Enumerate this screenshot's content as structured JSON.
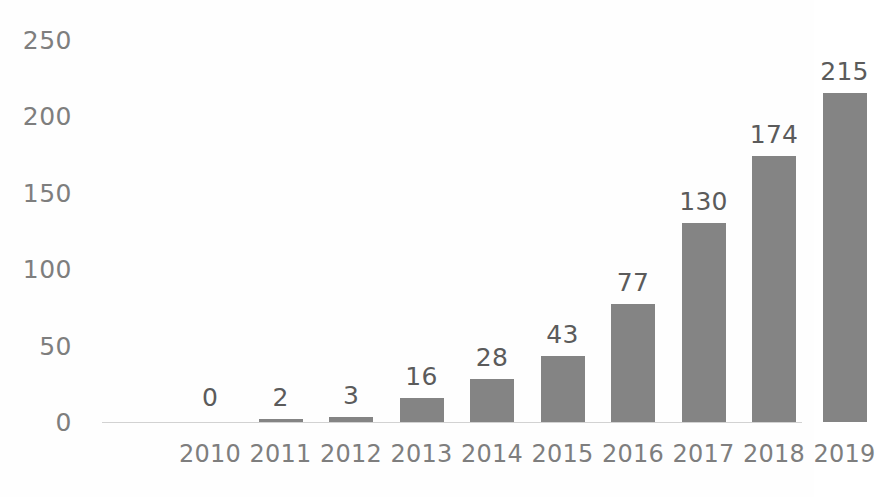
{
  "chart_data": {
    "type": "bar",
    "title": "",
    "subtitle": "",
    "xlabel": "",
    "ylabel": "",
    "categories": [
      "2010",
      "2011",
      "2012",
      "2013",
      "2014",
      "2015",
      "2016",
      "2017",
      "2018",
      "2019"
    ],
    "values": [
      0,
      2,
      3,
      16,
      28,
      43,
      77,
      130,
      174,
      215
    ],
    "value_labels": [
      "0",
      "2",
      "3",
      "16",
      "28",
      "43",
      "77",
      "130",
      "174",
      "215"
    ],
    "ylim": [
      0,
      250
    ],
    "y_ticks": [
      0,
      50,
      100,
      150,
      200,
      250
    ],
    "y_tick_labels": [
      "0",
      "50",
      "100",
      "150",
      "200",
      "250"
    ],
    "grid": false,
    "legend": null,
    "legend_position": "none",
    "bar_color": "#848484",
    "value_label_color": "#5b5b5b",
    "tick_label_color": "#7e7e7e",
    "axis_line_color": "#d2d2d2",
    "background_color": "#fefefe",
    "data_labels_shown": true
  }
}
